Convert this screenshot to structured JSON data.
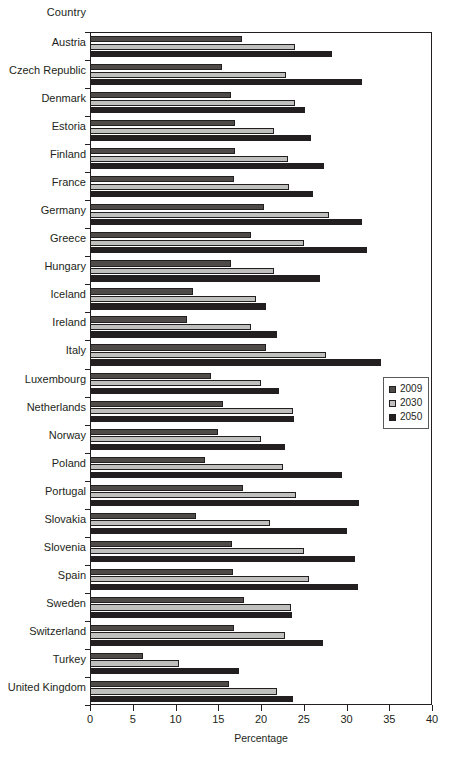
{
  "axis_header": "Country",
  "xaxis_title": "Percentage",
  "legend": {
    "position": "middle-right",
    "items": [
      {
        "label": "2009",
        "color": "#4d4a48"
      },
      {
        "label": "2030",
        "color": "#bfbfbd"
      },
      {
        "label": "2050",
        "color": "#231f20"
      }
    ]
  },
  "xticks": [
    "0",
    "5",
    "10",
    "15",
    "20",
    "25",
    "30",
    "35",
    "40"
  ],
  "chart_data": {
    "type": "bar",
    "orientation": "horizontal",
    "title": "",
    "xlabel": "Percentage",
    "ylabel": "Country",
    "xlim": [
      0,
      40
    ],
    "xtick_step": 5,
    "grid": false,
    "legend_position": "middle-right",
    "categories": [
      "Austria",
      "Czech Republic",
      "Denmark",
      "Estoria",
      "Finland",
      "France",
      "Germany",
      "Greece",
      "Hungary",
      "Iceland",
      "Ireland",
      "Italy",
      "Luxembourg",
      "Netherlands",
      "Norway",
      "Poland",
      "Portugal",
      "Slovakia",
      "Slovenia",
      "Spain",
      "Sweden",
      "Switzerland",
      "Turkey",
      "United Kingdom"
    ],
    "series": [
      {
        "name": "2009",
        "color": "#4d4a48",
        "values": [
          17.8,
          15.4,
          16.5,
          17.0,
          17.0,
          16.8,
          20.4,
          18.8,
          16.5,
          12.1,
          11.4,
          20.6,
          14.2,
          15.5,
          15.0,
          13.5,
          17.9,
          12.4,
          16.6,
          16.7,
          18.0,
          16.9,
          6.2,
          16.3
        ]
      },
      {
        "name": "2030",
        "color": "#bfbfbd",
        "values": [
          24.0,
          22.9,
          24.0,
          21.5,
          23.1,
          23.3,
          28.0,
          25.0,
          21.5,
          19.4,
          18.8,
          27.6,
          20.0,
          23.7,
          20.0,
          22.6,
          24.1,
          21.1,
          25.0,
          25.6,
          23.5,
          22.8,
          10.4,
          21.9
        ]
      },
      {
        "name": "2050",
        "color": "#231f20",
        "values": [
          28.3,
          31.8,
          25.2,
          25.8,
          27.4,
          26.1,
          31.8,
          32.4,
          26.9,
          20.6,
          21.9,
          34.0,
          22.1,
          23.9,
          22.8,
          29.5,
          31.5,
          30.1,
          31.0,
          31.4,
          23.6,
          27.2,
          17.4,
          23.7
        ]
      }
    ]
  }
}
